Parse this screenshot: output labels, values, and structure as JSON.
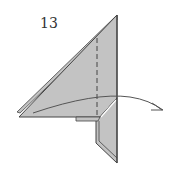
{
  "diagram": {
    "step_number": "13",
    "colors": {
      "paper_fill": "#c3c3c3",
      "paper_inner": "#d4d4d4",
      "line": "#444444",
      "arrow": "#555555",
      "background": "#ffffff"
    },
    "elements": [
      {
        "type": "folded-paper-triangle",
        "description": "large triangular flap pointing upward-left"
      },
      {
        "type": "valley-fold-line",
        "style": "dashed",
        "orientation": "vertical"
      },
      {
        "type": "lower-flap",
        "description": "narrow vertical flap hanging below"
      },
      {
        "type": "fold-arrow",
        "direction": "left-to-right",
        "description": "curved arrow indicating folding flap to the right"
      }
    ]
  }
}
